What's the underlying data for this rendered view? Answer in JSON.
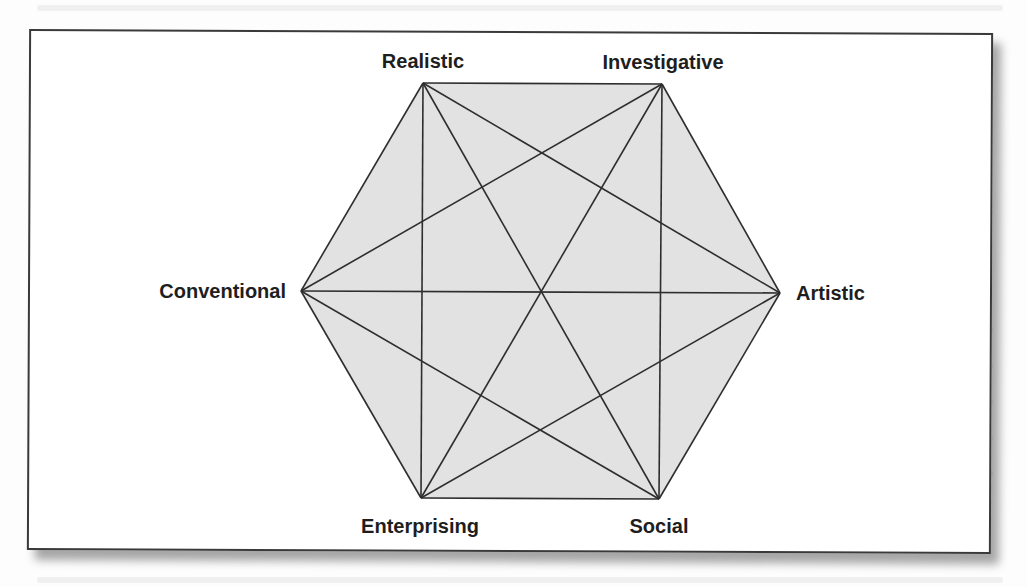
{
  "figure": {
    "type": "hexagon-model",
    "colors": {
      "fill": "#e2e2e2",
      "line": "#2e2e2e",
      "border": "#3a3a3a",
      "label": "#1e1e1e"
    },
    "vertices": [
      {
        "id": "realistic",
        "label": "Realistic",
        "x": 423,
        "y": 83,
        "label_x": 423,
        "label_y": 68,
        "anchor": "middle"
      },
      {
        "id": "investigative",
        "label": "Investigative",
        "x": 662,
        "y": 84,
        "label_x": 663,
        "label_y": 69,
        "anchor": "middle"
      },
      {
        "id": "artistic",
        "label": "Artistic",
        "x": 780,
        "y": 293,
        "label_x": 796,
        "label_y": 300,
        "anchor": "start"
      },
      {
        "id": "social",
        "label": "Social",
        "x": 659,
        "y": 499,
        "label_x": 659,
        "label_y": 533,
        "anchor": "middle"
      },
      {
        "id": "enterprising",
        "label": "Enterprising",
        "x": 421,
        "y": 498,
        "label_x": 420,
        "label_y": 533,
        "anchor": "middle"
      },
      {
        "id": "conventional",
        "label": "Conventional",
        "x": 301,
        "y": 291,
        "label_x": 286,
        "label_y": 298,
        "anchor": "end"
      }
    ],
    "edges_description": "Every vertex is connected to every other vertex (15 lines: 6 perimeter sides, 6 short diagonals, 3 long diagonals through the center)."
  }
}
